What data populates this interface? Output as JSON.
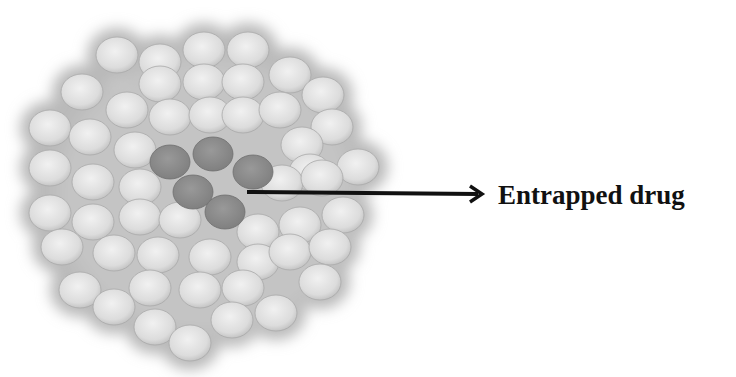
{
  "figure": {
    "type": "schematic",
    "annotation": {
      "label": "Entrapped drug",
      "arrow": "right-pointing arrow from drug core to label"
    },
    "colors": {
      "background": "#ffffff",
      "carrier_particle": "#e2e2e2",
      "carrier_edge": "#a8a8a8",
      "halo": "#b9b9b9",
      "drug_particle": "#8c8c8c",
      "arrow": "#111111",
      "label": "#111111"
    },
    "carrier_particles": [
      [
        117,
        55
      ],
      [
        160,
        62
      ],
      [
        204,
        50
      ],
      [
        248,
        50
      ],
      [
        82,
        92
      ],
      [
        160,
        84
      ],
      [
        204,
        82
      ],
      [
        243,
        82
      ],
      [
        290,
        75
      ],
      [
        323,
        95
      ],
      [
        127,
        110
      ],
      [
        170,
        117
      ],
      [
        210,
        115
      ],
      [
        243,
        115
      ],
      [
        280,
        110
      ],
      [
        332,
        127
      ],
      [
        50,
        128
      ],
      [
        90,
        137
      ],
      [
        135,
        150
      ],
      [
        302,
        145
      ],
      [
        310,
        172
      ],
      [
        358,
        167
      ],
      [
        50,
        168
      ],
      [
        93,
        182
      ],
      [
        140,
        187
      ],
      [
        282,
        183
      ],
      [
        322,
        178
      ],
      [
        50,
        213
      ],
      [
        93,
        222
      ],
      [
        140,
        217
      ],
      [
        180,
        220
      ],
      [
        258,
        232
      ],
      [
        300,
        225
      ],
      [
        343,
        215
      ],
      [
        62,
        247
      ],
      [
        114,
        253
      ],
      [
        158,
        255
      ],
      [
        210,
        257
      ],
      [
        258,
        262
      ],
      [
        290,
        252
      ],
      [
        330,
        247
      ],
      [
        80,
        290
      ],
      [
        114,
        307
      ],
      [
        150,
        288
      ],
      [
        200,
        290
      ],
      [
        243,
        288
      ],
      [
        320,
        282
      ],
      [
        155,
        327
      ],
      [
        190,
        343
      ],
      [
        232,
        320
      ],
      [
        276,
        313
      ]
    ],
    "drug_particles": [
      [
        170,
        162
      ],
      [
        213,
        154
      ],
      [
        253,
        172
      ],
      [
        193,
        192
      ],
      [
        225,
        212
      ]
    ]
  }
}
